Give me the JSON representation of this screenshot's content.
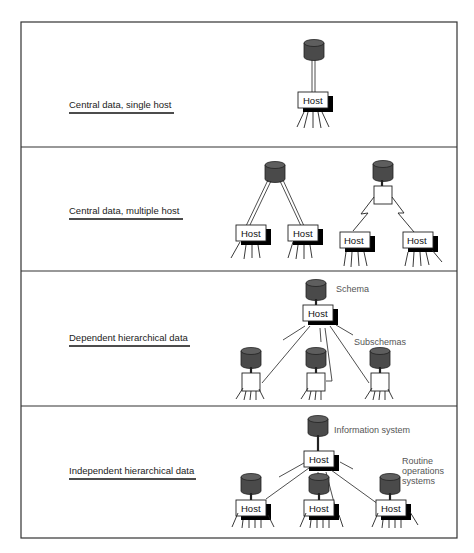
{
  "figure": {
    "panels": [
      {
        "id": "panel-1",
        "label": "Central data, single host",
        "hosts": [
          "Host"
        ],
        "annotations": []
      },
      {
        "id": "panel-2",
        "label": "Central data, multiple host",
        "hosts": [
          "Host",
          "Host",
          "Host",
          "Host"
        ],
        "annotations": []
      },
      {
        "id": "panel-3",
        "label": "Dependent hierarchical data",
        "hosts": [
          "Host"
        ],
        "annotations": [
          "Schema",
          "Subschemas"
        ]
      },
      {
        "id": "panel-4",
        "label": "Independent hierarchical data",
        "hosts": [
          "Host",
          "Host",
          "Host",
          "Host"
        ],
        "annotations": [
          "Information system",
          "Routine",
          "operations",
          "systems"
        ]
      }
    ]
  },
  "colors": {
    "border": "#333333",
    "database": "#4a4a4a",
    "database_top": "#5e5e5e",
    "shadow": "#000000",
    "line": "#222222",
    "annotation_text": "#555555"
  }
}
